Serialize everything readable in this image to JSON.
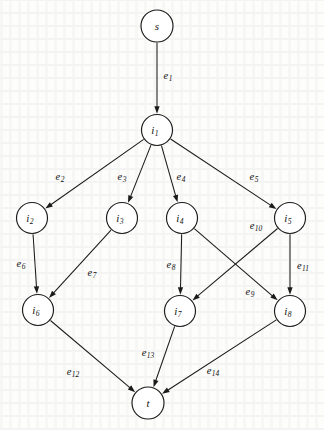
{
  "figure": {
    "kind": "directed-graph",
    "width": 324,
    "height": 430,
    "background_color": "#fdfdfc",
    "ink_color": "#1b1b1b",
    "node_radius": 15.5,
    "source_node": "s",
    "sink_node": "t"
  },
  "nodes": [
    {
      "id": "s",
      "base": "s",
      "sub": "",
      "cx": 157,
      "cy": 26,
      "r": 16.0
    },
    {
      "id": "i1",
      "base": "i",
      "sub": "1",
      "cx": 157,
      "cy": 130,
      "r": 15.5
    },
    {
      "id": "i2",
      "base": "i",
      "sub": "2",
      "cx": 32,
      "cy": 218,
      "r": 15.5
    },
    {
      "id": "i3",
      "base": "i",
      "sub": "3",
      "cx": 122,
      "cy": 218,
      "r": 15.5
    },
    {
      "id": "i4",
      "base": "i",
      "sub": "4",
      "cx": 182,
      "cy": 218,
      "r": 15.5
    },
    {
      "id": "i5",
      "base": "i",
      "sub": "5",
      "cx": 290,
      "cy": 218,
      "r": 15.5
    },
    {
      "id": "i6",
      "base": "i",
      "sub": "6",
      "cx": 38,
      "cy": 310,
      "r": 15.5
    },
    {
      "id": "i7",
      "base": "i",
      "sub": "7",
      "cx": 180,
      "cy": 311,
      "r": 15.5
    },
    {
      "id": "i8",
      "base": "i",
      "sub": "8",
      "cx": 290,
      "cy": 311,
      "r": 15.5
    },
    {
      "id": "t",
      "base": "t",
      "sub": "",
      "cx": 148,
      "cy": 403,
      "r": 16.0
    }
  ],
  "edges": [
    {
      "id": "e1",
      "base": "e",
      "sub": "1",
      "from": "s",
      "to": "i1",
      "label_x": 168,
      "label_y": 75
    },
    {
      "id": "e2",
      "base": "e",
      "sub": "2",
      "from": "i1",
      "to": "i2",
      "label_x": 60,
      "label_y": 176
    },
    {
      "id": "e3",
      "base": "e",
      "sub": "3",
      "from": "i1",
      "to": "i3",
      "label_x": 122,
      "label_y": 176
    },
    {
      "id": "e4",
      "base": "e",
      "sub": "4",
      "from": "i1",
      "to": "i4",
      "label_x": 181,
      "label_y": 176
    },
    {
      "id": "e5",
      "base": "e",
      "sub": "5",
      "from": "i1",
      "to": "i5",
      "label_x": 254,
      "label_y": 176
    },
    {
      "id": "e6",
      "base": "e",
      "sub": "6",
      "from": "i2",
      "to": "i6",
      "label_x": 21,
      "label_y": 263
    },
    {
      "id": "e7",
      "base": "e",
      "sub": "7",
      "from": "i3",
      "to": "i6",
      "label_x": 92,
      "label_y": 272
    },
    {
      "id": "e8",
      "base": "e",
      "sub": "8",
      "from": "i4",
      "to": "i7",
      "label_x": 171,
      "label_y": 264
    },
    {
      "id": "e9",
      "base": "e",
      "sub": "9",
      "from": "i4",
      "to": "i8",
      "label_x": 250,
      "label_y": 291
    },
    {
      "id": "e10",
      "base": "e",
      "sub": "10",
      "from": "i5",
      "to": "i7",
      "label_x": 256,
      "label_y": 225
    },
    {
      "id": "e11",
      "base": "e",
      "sub": "11",
      "from": "i5",
      "to": "i8",
      "label_x": 303,
      "label_y": 265
    },
    {
      "id": "e12",
      "base": "e",
      "sub": "12",
      "from": "i6",
      "to": "t",
      "label_x": 73,
      "label_y": 371
    },
    {
      "id": "e13",
      "base": "e",
      "sub": "13",
      "from": "i7",
      "to": "t",
      "label_x": 148,
      "label_y": 352
    },
    {
      "id": "e14",
      "base": "e",
      "sub": "14",
      "from": "i8",
      "to": "t",
      "label_x": 213,
      "label_y": 370
    }
  ]
}
